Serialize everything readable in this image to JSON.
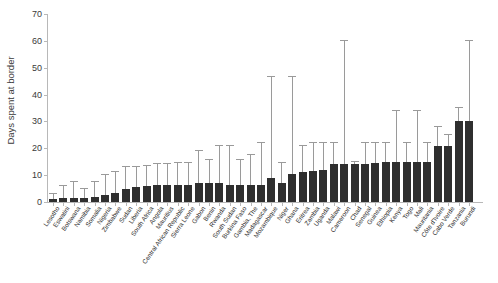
{
  "chart_data": {
    "type": "bar",
    "title": "",
    "xlabel": "",
    "ylabel": "Days spent at border",
    "ylim": [
      0,
      70
    ],
    "yticks": [
      0,
      10,
      20,
      30,
      40,
      50,
      60,
      70
    ],
    "grid": false,
    "legend": false,
    "error_bars": "upper whisker with cap",
    "bar_color": "#2f2f2f",
    "whisker_color": "#9a9a9a",
    "categories": [
      "Lesotho",
      "Eswatini",
      "Botswana",
      "Namibia",
      "Somalia",
      "Nigeria",
      "Zimbabwe",
      "Sudan",
      "Liberia",
      "South Africa",
      "Angola",
      "Mauritius",
      "Central African Republic",
      "Sierra Leone",
      "Gabon",
      "Benin",
      "Rwanda",
      "South Sudan",
      "Burkina Faso",
      "Gambia, The",
      "Madagascar",
      "Mozambique",
      "Niger",
      "Ghana",
      "Eritrea",
      "Zambia",
      "Uganda",
      "Malawi",
      "Cameroon",
      "Chad",
      "Senegal",
      "Guinea",
      "Ethiopia",
      "Kenya",
      "Togo",
      "Mali",
      "Mauritania",
      "Côte d'Ivoire",
      "Cabo Verde",
      "Tanzania",
      "Burundi"
    ],
    "values": [
      1.0,
      1.5,
      1.5,
      1.5,
      2.0,
      2.5,
      3.5,
      5.0,
      5.5,
      6.0,
      6.5,
      6.5,
      6.5,
      6.5,
      7.0,
      7.0,
      7.0,
      6.5,
      6.5,
      6.5,
      6.5,
      9.0,
      7.0,
      10.5,
      11.0,
      11.5,
      12.0,
      14.0,
      14.0,
      14.0,
      14.0,
      14.5,
      15.0,
      15.0,
      15.0,
      15.0,
      15.0,
      21.0,
      21.0,
      30.0,
      30.0
    ],
    "upper_whisker": [
      3.0,
      6.0,
      7.5,
      5.0,
      7.5,
      10.0,
      11.0,
      13.0,
      13.0,
      13.5,
      14.0,
      14.0,
      14.5,
      14.5,
      19.0,
      15.5,
      21.0,
      21.0,
      15.5,
      17.5,
      22.0,
      46.5,
      14.5,
      46.5,
      21.0,
      22.0,
      22.0,
      22.0,
      60.0,
      15.0,
      22.0,
      22.0,
      22.0,
      34.0,
      22.0,
      34.0,
      22.0,
      28.0,
      25.0,
      35.0,
      60.0
    ]
  }
}
